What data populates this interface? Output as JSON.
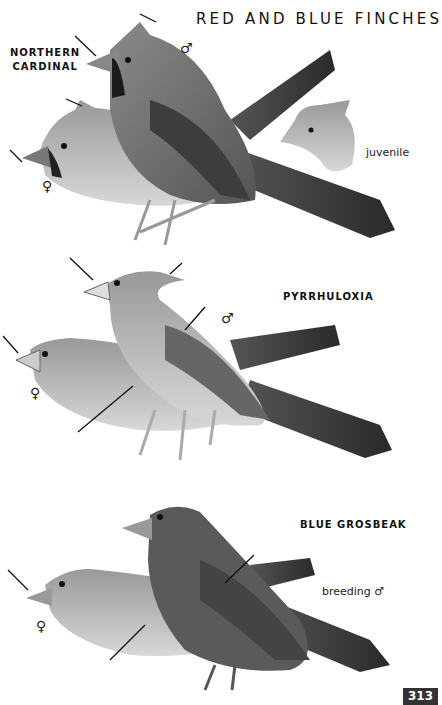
{
  "page": {
    "title": "RED AND BLUE FINCHES",
    "page_number": "313"
  },
  "species": [
    {
      "name_line1": "NORTHERN",
      "name_line2": "CARDINAL",
      "labels": {
        "male": "♂",
        "female": "♀",
        "juvenile": "juvenile"
      }
    },
    {
      "name": "PYRRHULOXIA",
      "labels": {
        "male": "♂",
        "female": "♀"
      }
    },
    {
      "name": "BLUE GROSBEAK",
      "labels": {
        "breeding_male": "breeding ♂",
        "female": "♀"
      }
    }
  ],
  "colors": {
    "page_bg": "#ffffff",
    "text": "#111111",
    "page_number_bg": "#333333",
    "page_number_text": "#ffffff"
  }
}
